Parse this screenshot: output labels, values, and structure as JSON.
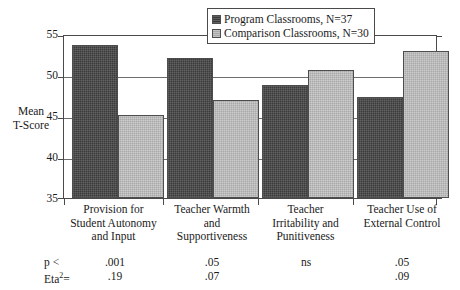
{
  "chart_data": {
    "type": "bar",
    "title": "",
    "xlabel": "",
    "ylabel": "Mean T-Score",
    "ylim": [
      35,
      55
    ],
    "yticks": [
      35,
      40,
      45,
      50,
      55
    ],
    "grid": true,
    "legend_position": "top-center",
    "categories": [
      "Provision for Student Autonomy and Input",
      "Teacher Warmth and Supportiveness",
      "Teacher Irritability and Punitiveness",
      "Teacher Use of External Control"
    ],
    "series": [
      {
        "name": "Program Classrooms, N=37",
        "values": [
          53.9,
          52.3,
          49.0,
          47.5
        ],
        "color": "#3b3b3b"
      },
      {
        "name": "Comparison Classrooms, N=30",
        "values": [
          45.2,
          47.1,
          50.8,
          53.2
        ],
        "color": "#a9a9a9"
      }
    ],
    "annotations": {
      "p_label": "p <",
      "eta_label": "Eta",
      "eta_label_sup": "2",
      "eta_label_eq": "=",
      "p_values": [
        ".001",
        ".05",
        "ns",
        ".05"
      ],
      "eta_values": [
        ".19",
        ".07",
        "",
        ".09"
      ]
    }
  },
  "axis": {
    "y_title_line1": "Mean",
    "y_title_line2": "T-Score",
    "ytick_labels": [
      "55",
      "50",
      "45",
      "40",
      "35"
    ]
  },
  "legend": {
    "entries": [
      {
        "label": "Program Classrooms, N=37"
      },
      {
        "label": "Comparison Classrooms, N=30"
      }
    ]
  },
  "category_labels": [
    {
      "lines": [
        "Provision for",
        "Student Autonomy",
        "and Input"
      ]
    },
    {
      "lines": [
        "Teacher Warmth",
        "and",
        "Supportiveness"
      ]
    },
    {
      "lines": [
        "Teacher",
        "Irritability and",
        "Punitiveness"
      ]
    },
    {
      "lines": [
        "Teacher Use of",
        "External Control"
      ]
    }
  ]
}
